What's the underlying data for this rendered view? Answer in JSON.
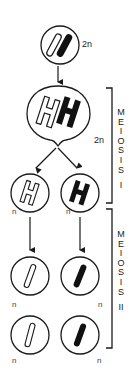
{
  "diagram": {
    "colors": {
      "stroke": "#1a1a1a",
      "fill_dark": "#111111",
      "background": "#ffffff"
    },
    "parent_cell": {
      "ploidy_label": "2n",
      "chromosomes": [
        "light",
        "dark"
      ]
    },
    "replicated_cell": {
      "ploidy_label": "2n",
      "chromosomes": [
        "light-replicated",
        "dark-replicated"
      ]
    },
    "meiosis_1_cells": [
      {
        "ploidy_label": "n",
        "chromosome": "light-replicated"
      },
      {
        "ploidy_label": "n",
        "chromosome": "dark-replicated"
      }
    ],
    "meiosis_2_cells": [
      {
        "ploidy_label": "n",
        "chromosome": "light"
      },
      {
        "ploidy_label": "n",
        "chromosome": "dark"
      },
      {
        "ploidy_label": "n",
        "chromosome": "light"
      },
      {
        "ploidy_label": "n",
        "chromosome": "dark"
      }
    ],
    "stages": [
      {
        "label_letters": [
          "M",
          "E",
          "I",
          "O",
          "S",
          "I",
          "S"
        ],
        "numeral": "I"
      },
      {
        "label_letters": [
          "M",
          "E",
          "I",
          "O",
          "S",
          "I",
          "S"
        ],
        "numeral": "II"
      }
    ]
  }
}
